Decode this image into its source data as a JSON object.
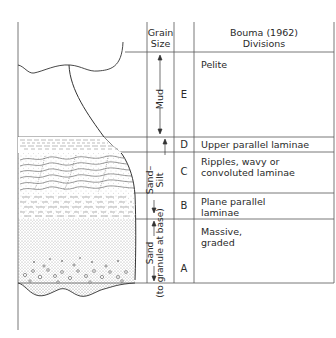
{
  "header": {
    "grain_size_line1": "Grain",
    "grain_size_line2": "Size",
    "divisions_line1": "Bouma (1962)",
    "divisions_line2": "Divisions"
  },
  "grain_sizes": {
    "mud": "Mud",
    "sand_silt_line1": "Sand–",
    "sand_silt_line2": "Silt",
    "sand_line1": "Sand",
    "sand_line2": "(to granule at base)"
  },
  "divisions": [
    {
      "letter": "E",
      "description": "Pelite"
    },
    {
      "letter": "D",
      "description": "Upper parallel laminae"
    },
    {
      "letter": "C",
      "description_line1": "Ripples, wavy or",
      "description_line2": "convoluted laminae"
    },
    {
      "letter": "B",
      "description_line1": "Plane parallel",
      "description_line2": "laminae"
    },
    {
      "letter": "A",
      "description_line1": "Massive,",
      "description_line2": "graded"
    }
  ],
  "colors": {
    "line": "#555555",
    "text": "#2a2a2a"
  }
}
